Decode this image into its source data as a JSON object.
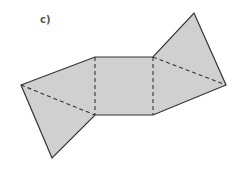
{
  "label": "c)",
  "figure": {
    "fill_color": "#d0d0d0",
    "stroke_color": "#333333",
    "outline": [
      [
        21,
        85
      ],
      [
        95,
        57
      ],
      [
        153,
        57
      ],
      [
        194,
        13
      ],
      [
        226,
        85
      ],
      [
        153,
        115
      ],
      [
        95,
        115
      ],
      [
        52,
        158
      ]
    ],
    "fold_lines": [
      {
        "from": [
          95,
          57
        ],
        "to": [
          95,
          115
        ]
      },
      {
        "from": [
          153,
          57
        ],
        "to": [
          153,
          115
        ]
      },
      {
        "from": [
          21,
          85
        ],
        "to": [
          95,
          115
        ]
      },
      {
        "from": [
          153,
          57
        ],
        "to": [
          226,
          85
        ]
      }
    ]
  }
}
